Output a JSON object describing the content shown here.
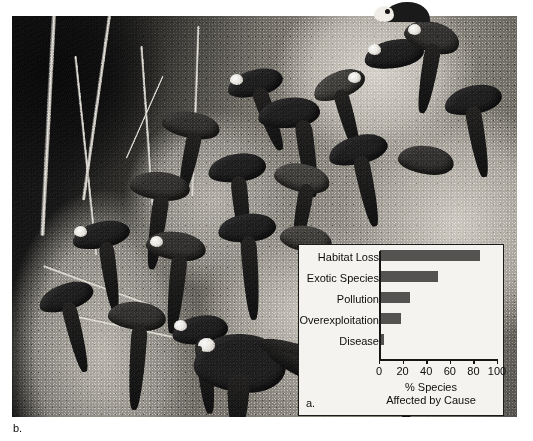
{
  "figure": {
    "panel_b_label": "b.",
    "photo": {
      "name": "macaws-on-clay-lick-photograph",
      "description": "Black and white photograph of many macaws clustered on a clay lick cliff face"
    }
  },
  "chart_data": {
    "type": "bar",
    "orientation": "horizontal",
    "panel_label": "a.",
    "title": "",
    "categories": [
      "Habitat Loss",
      "Exotic Species",
      "Pollution",
      "Overexploitation",
      "Disease"
    ],
    "values": [
      85,
      49,
      25,
      18,
      3
    ],
    "xlabel": "% Species Affected by Cause",
    "xlabel_line1": "% Species",
    "xlabel_line2": "Affected by Cause",
    "ylabel": "",
    "xlim": [
      0,
      100
    ],
    "xticks": [
      0,
      20,
      40,
      60,
      80,
      100
    ],
    "xtick_labels": [
      "0",
      "20",
      "40",
      "60",
      "80",
      "100"
    ],
    "grid": false,
    "legend": false,
    "bar_color": "#545352",
    "background_color": "#f4f3f0",
    "axis_color": "#161616"
  }
}
